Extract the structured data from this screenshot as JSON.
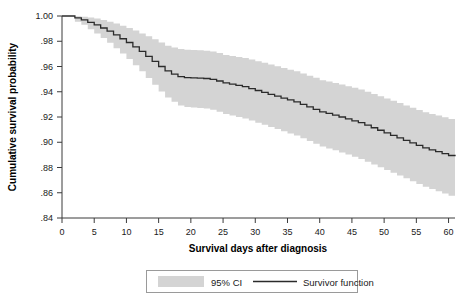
{
  "chart_data": {
    "type": "line",
    "title": "",
    "xlabel": "Survival days after diagnosis",
    "ylabel": "Cumulative survival probability",
    "xlim": [
      0,
      61
    ],
    "ylim": [
      0.84,
      1.0
    ],
    "xticks": [
      0,
      5,
      10,
      15,
      20,
      25,
      30,
      35,
      40,
      45,
      50,
      55,
      60
    ],
    "xticklabels": [
      "0",
      "5",
      "10",
      "15",
      "20",
      "25",
      "30",
      "35",
      "40",
      "45",
      "50",
      "55",
      "60"
    ],
    "yticks": [
      0.84,
      0.86,
      0.88,
      0.9,
      0.92,
      0.94,
      0.96,
      0.98,
      1.0
    ],
    "yticklabels": [
      ".84",
      ".86",
      ".88",
      ".90",
      ".92",
      ".94",
      ".96",
      ".98",
      "1.00"
    ],
    "grid": false,
    "step": "post",
    "legend_position": "below-center",
    "legend": [
      "95% CI",
      "Survivor function"
    ],
    "colors": {
      "ci_band": "#d4d4d4",
      "survivor_line": "#2b2b2b",
      "axis": "#3a3a3a",
      "background": "#ffffff"
    },
    "series": [
      {
        "name": "Survivor function",
        "x": [
          0,
          1,
          2,
          3,
          4,
          5,
          6,
          7,
          8,
          9,
          10,
          11,
          12,
          13,
          14,
          15,
          16,
          17,
          18,
          19,
          20,
          21,
          22,
          23,
          24,
          25,
          26,
          27,
          28,
          29,
          30,
          31,
          32,
          33,
          34,
          35,
          36,
          37,
          38,
          39,
          40,
          41,
          42,
          43,
          44,
          45,
          46,
          47,
          48,
          49,
          50,
          51,
          52,
          53,
          54,
          55,
          56,
          57,
          58,
          59,
          60,
          61
        ],
        "values": [
          1.0,
          1.0,
          0.9985,
          0.997,
          0.995,
          0.993,
          0.9905,
          0.988,
          0.985,
          0.982,
          0.979,
          0.9755,
          0.972,
          0.968,
          0.964,
          0.96,
          0.9565,
          0.954,
          0.952,
          0.9512,
          0.951,
          0.9508,
          0.9505,
          0.9498,
          0.9485,
          0.947,
          0.946,
          0.945,
          0.944,
          0.9425,
          0.941,
          0.9395,
          0.938,
          0.9365,
          0.935,
          0.9335,
          0.932,
          0.93,
          0.928,
          0.926,
          0.924,
          0.9228,
          0.9215,
          0.92,
          0.9185,
          0.917,
          0.9155,
          0.9135,
          0.9115,
          0.9095,
          0.9075,
          0.9055,
          0.9035,
          0.9015,
          0.8995,
          0.8975,
          0.8955,
          0.894,
          0.8925,
          0.891,
          0.8895,
          0.889
        ]
      },
      {
        "name": "95% CI upper",
        "x": [
          0,
          1,
          2,
          3,
          4,
          5,
          6,
          7,
          8,
          9,
          10,
          11,
          12,
          13,
          14,
          15,
          16,
          17,
          18,
          19,
          20,
          21,
          22,
          23,
          24,
          25,
          26,
          27,
          28,
          29,
          30,
          31,
          32,
          33,
          34,
          35,
          36,
          37,
          38,
          39,
          40,
          41,
          42,
          43,
          44,
          45,
          46,
          47,
          48,
          49,
          50,
          51,
          52,
          53,
          54,
          55,
          56,
          57,
          58,
          59,
          60,
          61
        ],
        "values": [
          1.0,
          1.0,
          0.9998,
          0.9995,
          0.9988,
          0.998,
          0.9968,
          0.9955,
          0.994,
          0.9922,
          0.9905,
          0.9885,
          0.9862,
          0.984,
          0.9815,
          0.979,
          0.9765,
          0.975,
          0.9738,
          0.9732,
          0.973,
          0.9728,
          0.9725,
          0.9718,
          0.9706,
          0.9692,
          0.9684,
          0.9676,
          0.9668,
          0.9655,
          0.9642,
          0.9629,
          0.9616,
          0.9602,
          0.9588,
          0.9575,
          0.9562,
          0.9545,
          0.9527,
          0.951,
          0.9492,
          0.9481,
          0.947,
          0.9457,
          0.9444,
          0.9431,
          0.9418,
          0.94,
          0.9382,
          0.9364,
          0.9346,
          0.9328,
          0.931,
          0.9292,
          0.9274,
          0.9256,
          0.9238,
          0.9224,
          0.9211,
          0.9198,
          0.9185,
          0.918
        ]
      },
      {
        "name": "95% CI lower",
        "x": [
          0,
          1,
          2,
          3,
          4,
          5,
          6,
          7,
          8,
          9,
          10,
          11,
          12,
          13,
          14,
          15,
          16,
          17,
          18,
          19,
          20,
          21,
          22,
          23,
          24,
          25,
          26,
          27,
          28,
          29,
          30,
          31,
          32,
          33,
          34,
          35,
          36,
          37,
          38,
          39,
          40,
          41,
          42,
          43,
          44,
          45,
          46,
          47,
          48,
          49,
          50,
          51,
          52,
          53,
          54,
          55,
          56,
          57,
          58,
          59,
          60,
          61
        ],
        "values": [
          1.0,
          1.0,
          0.9955,
          0.993,
          0.9895,
          0.9862,
          0.9825,
          0.9788,
          0.9745,
          0.9702,
          0.966,
          0.961,
          0.9562,
          0.9508,
          0.9455,
          0.9402,
          0.9355,
          0.932,
          0.9292,
          0.928,
          0.9275,
          0.9272,
          0.9268,
          0.9258,
          0.9242,
          0.9224,
          0.9212,
          0.92,
          0.9188,
          0.9172,
          0.9155,
          0.9138,
          0.9121,
          0.9104,
          0.9087,
          0.907,
          0.9053,
          0.9032,
          0.901,
          0.8988,
          0.8966,
          0.8951,
          0.8936,
          0.8919,
          0.8902,
          0.8885,
          0.8868,
          0.8846,
          0.8824,
          0.8802,
          0.878,
          0.8758,
          0.8736,
          0.8714,
          0.8692,
          0.867,
          0.8648,
          0.863,
          0.8612,
          0.8594,
          0.8576,
          0.857
        ]
      }
    ]
  },
  "axes": {
    "y_title": "Cumulative survival probability",
    "x_title": "Survival days after diagnosis"
  },
  "legend": {
    "ci_label": "95% CI",
    "line_label": "Survivor function"
  }
}
